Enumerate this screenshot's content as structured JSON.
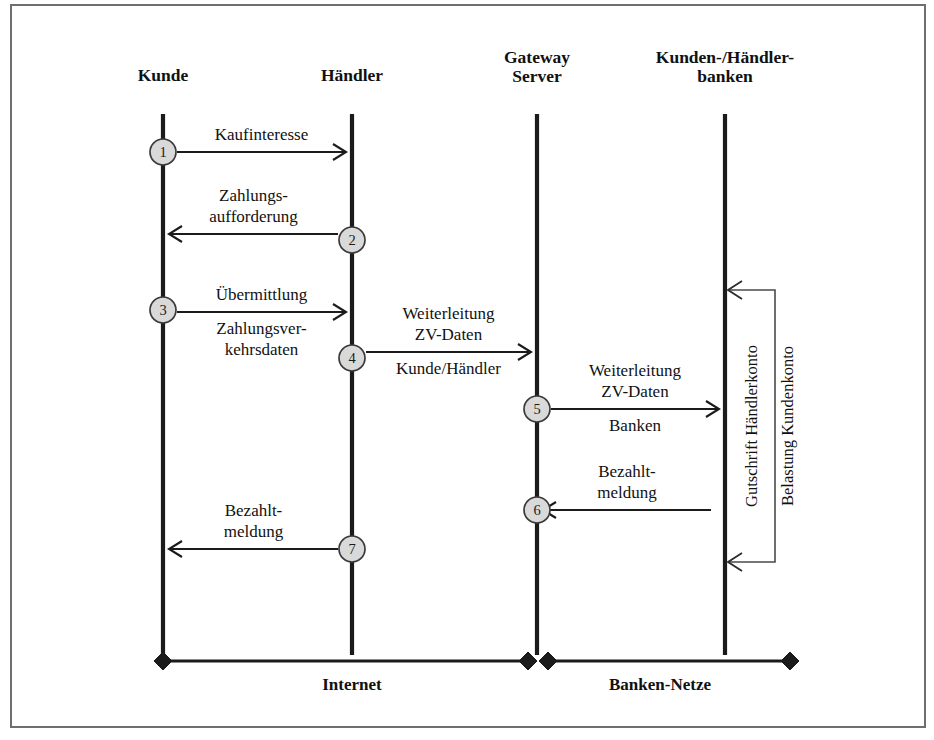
{
  "figure": {
    "border_color": "#6f6f6f",
    "lifeline_color": "#1b1b1b",
    "circle_fill": "#d9d9d9",
    "circle_stroke": "#3a3a3a",
    "background": "#ffffff"
  },
  "actors": [
    {
      "id": "kunde",
      "label_line1": "Kunde",
      "label_line2": "",
      "x": 163
    },
    {
      "id": "haendler",
      "label_line1": "Händler",
      "label_line2": "",
      "x": 352
    },
    {
      "id": "gateway",
      "label_line1": "Gateway",
      "label_line2": "Server",
      "x": 537
    },
    {
      "id": "banken",
      "label_line1": "Kunden-/Händler-",
      "label_line2": "banken",
      "x": 725
    }
  ],
  "lifeline": {
    "top_y": 114,
    "bottom_y": 655
  },
  "messages": [
    {
      "step": "1",
      "from": "kunde",
      "to": "haendler",
      "direction": "right",
      "y": 152,
      "labels_above": [
        "Kaufinteresse"
      ],
      "labels_below": [],
      "circle_actor": "kunde",
      "circle_y": 152
    },
    {
      "step": "2",
      "from": "haendler",
      "to": "kunde",
      "direction": "left",
      "y": 234,
      "labels_above": [
        "Zahlungs-",
        "aufforderung"
      ],
      "labels_below": [],
      "circle_actor": "haendler",
      "circle_y": 240
    },
    {
      "step": "3",
      "from": "kunde",
      "to": "haendler",
      "direction": "right",
      "y": 312,
      "labels_above": [
        "Übermittlung"
      ],
      "labels_below": [
        "Zahlungsver-",
        "kehrsdaten"
      ],
      "circle_actor": "kunde",
      "circle_y": 310
    },
    {
      "step": "4",
      "from": "haendler",
      "to": "gateway",
      "direction": "right",
      "y": 352,
      "labels_above": [
        "Weiterleitung",
        "ZV-Daten"
      ],
      "labels_below": [
        "Kunde/Händler"
      ],
      "circle_actor": "haendler",
      "circle_y": 358
    },
    {
      "step": "5",
      "from": "gateway",
      "to": "banken",
      "direction": "right",
      "y": 409,
      "labels_above": [
        "Weiterleitung",
        "ZV-Daten"
      ],
      "labels_below": [
        "Banken"
      ],
      "circle_actor": "gateway",
      "circle_y": 409
    },
    {
      "step": "6",
      "from": "banken",
      "to": "gateway",
      "direction": "left",
      "y": 510,
      "labels_above": [
        "Bezahlt-",
        "meldung"
      ],
      "labels_below": [],
      "circle_actor": "gateway",
      "circle_y": 510
    },
    {
      "step": "7",
      "from": "haendler",
      "to": "kunde",
      "direction": "left",
      "y": 549,
      "labels_above": [
        "Bezahlt-",
        "meldung"
      ],
      "labels_below": [],
      "circle_actor": "haendler",
      "circle_y": 549
    }
  ],
  "bank_bracket": {
    "actor": "banken",
    "right_x": 775,
    "top_y": 290,
    "bottom_y": 562,
    "labels": [
      {
        "text": "Belastung Kundenkonto",
        "x": 793,
        "y": 426
      },
      {
        "text": "Gutschrift Händlerkonto",
        "x": 757,
        "y": 426
      }
    ]
  },
  "networks": [
    {
      "id": "internet",
      "label": "Internet",
      "x1": 163,
      "x2": 528,
      "y": 661,
      "label_x": 352,
      "label_y": 690
    },
    {
      "id": "banken-netze",
      "label": "Banken-Netze",
      "x1": 548,
      "x2": 790,
      "y": 661,
      "label_x": 660,
      "label_y": 690
    }
  ],
  "frame": {
    "x": 11,
    "y": 5,
    "width": 914,
    "height": 722
  }
}
